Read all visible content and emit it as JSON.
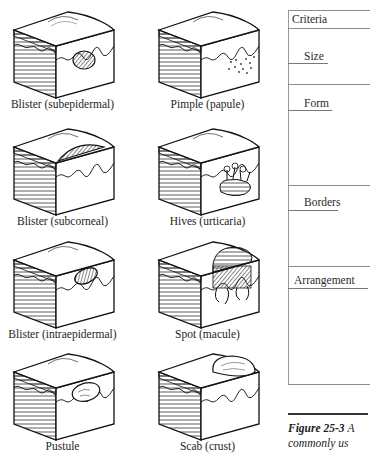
{
  "illustrations": [
    {
      "label": "Blister (subepidermal)",
      "lesion": "subepidermal-blister"
    },
    {
      "label": "Pimple (papule)",
      "lesion": "papule"
    },
    {
      "label": "Blister (subcorneal)",
      "lesion": "subcorneal-blister"
    },
    {
      "label": "Hives (urticaria)",
      "lesion": "urticaria"
    },
    {
      "label": "Blister (intraepidermal)",
      "lesion": "intraepidermal-blister"
    },
    {
      "label": "Spot (macule)",
      "lesion": "macule"
    },
    {
      "label": "Pustule",
      "lesion": "pustule"
    },
    {
      "label": "Scab (crust)",
      "lesion": "crust"
    }
  ],
  "table": {
    "header": "Criteria",
    "rows": [
      "Size",
      "Form",
      "Borders",
      "Arrangement"
    ]
  },
  "caption": {
    "figure_number": "Figure 25-3",
    "text_line1": "A",
    "text_line2": "commonly us"
  }
}
